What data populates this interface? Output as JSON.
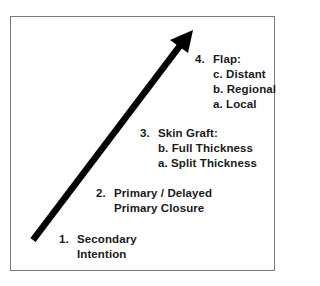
{
  "diagram": {
    "type": "reconstructive-ladder",
    "arrow": {
      "from": [
        33,
        240
      ],
      "to": [
        192,
        31
      ],
      "color": "#000000"
    },
    "border_color": "#7a7a7a",
    "steps": [
      {
        "number": "1.",
        "title": "Secondary",
        "lines": [
          "Intention"
        ]
      },
      {
        "number": "2.",
        "title": "Primary / Delayed",
        "lines": [
          "Primary Closure"
        ]
      },
      {
        "number": "3.",
        "title": "Skin Graft:",
        "lines": [
          "b. Full Thickness",
          "a. Split Thickness"
        ]
      },
      {
        "number": "4.",
        "title": "Flap:",
        "lines": [
          "c. Distant",
          "b. Regional",
          "a. Local"
        ]
      }
    ]
  }
}
